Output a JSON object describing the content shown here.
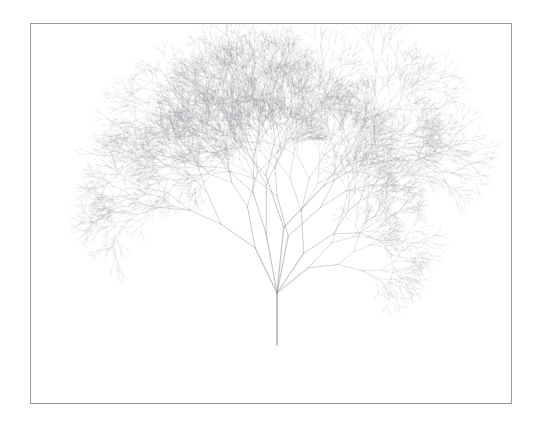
{
  "figure": {
    "background_color": "#ffffff"
  },
  "canvas": {
    "frame_color": "#9a9a9a",
    "frame_border_width": 1,
    "frame_left": 30,
    "frame_top": 23,
    "frame_width": 482,
    "frame_height": 381,
    "fill_color": "#ffffff"
  },
  "chart_data": {
    "type": "line",
    "subtitle": "",
    "xlabel": "",
    "ylabel": "",
    "grid": false,
    "legend": null,
    "render": {
      "stroke_color": "#8e8e96",
      "stroke_color_hex": "#8e8e96",
      "trunk_color": "#b0b0b6",
      "base_opacity": 0.5,
      "tip_opacity": 0.28,
      "line_cap": "round"
    },
    "tree": {
      "base_x": 277,
      "base_y": 345,
      "trunk_top_y": 293,
      "trunk_length": 52,
      "trunk_width": 1.5,
      "depth": 11,
      "branch_angle_left_deg": 22,
      "branch_angle_right_deg": 20,
      "length_ratio_left": 0.78,
      "length_ratio_right": 0.76,
      "width_ratio": 0.8,
      "angle_jitter_deg": 16,
      "length_jitter": 0.24,
      "seed": 20240517,
      "canopy_top_y": 103,
      "canopy_left_x": 148,
      "canopy_right_x": 405,
      "canopy_bottom_y": 300
    },
    "annotations": []
  }
}
